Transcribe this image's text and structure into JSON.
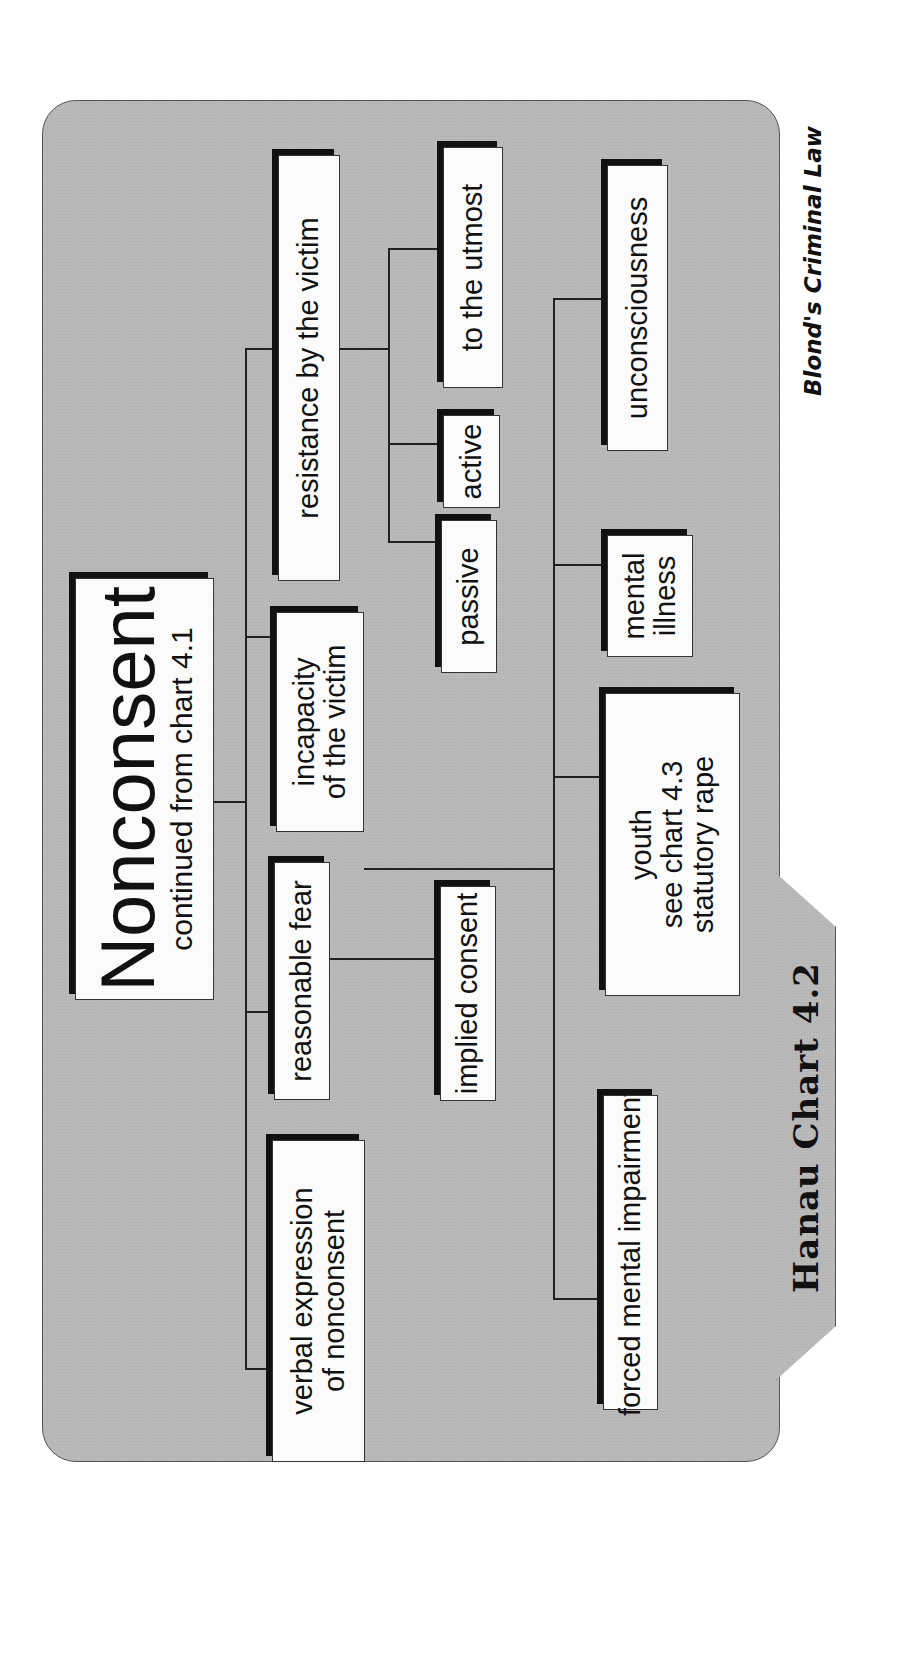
{
  "chart": {
    "tab_label": "Hanau Chart 4.2",
    "credit": "Blond's Criminal Law",
    "root": {
      "title": "Nonconsent",
      "subtitle": "continued from chart 4.1"
    },
    "level1": [
      {
        "lines": [
          "verbal expression",
          "of nonconsent"
        ]
      },
      {
        "lines": [
          "reasonable fear"
        ]
      },
      {
        "lines": [
          "incapacity",
          "of the victim"
        ]
      },
      {
        "lines": [
          "resistance by the victim"
        ]
      }
    ],
    "reasonable_fear_children": [
      {
        "lines": [
          "implied consent"
        ]
      }
    ],
    "resistance_children": [
      {
        "lines": [
          "passive"
        ]
      },
      {
        "lines": [
          "active"
        ]
      },
      {
        "lines": [
          "to the utmost"
        ]
      }
    ],
    "incapacity_children": [
      {
        "lines": [
          "forced mental impairment"
        ]
      },
      {
        "lines": [
          "youth",
          "see chart 4.3",
          "statutory rape"
        ]
      },
      {
        "lines": [
          "mental",
          "illness"
        ]
      },
      {
        "lines": [
          "unconsciousness"
        ]
      }
    ]
  },
  "colors": {
    "panel": "#b9b9b9",
    "box": "#fbfbfb",
    "shadow": "#111111",
    "line": "#222222"
  }
}
